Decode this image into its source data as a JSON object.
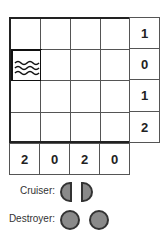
{
  "puzzle": {
    "rows": 4,
    "cols": 4,
    "row_clues": [
      "1",
      "0",
      "1",
      "2"
    ],
    "col_clues": [
      "2",
      "0",
      "2",
      "0"
    ],
    "given_cells": [
      {
        "row": 1,
        "col": 0,
        "type": "water"
      }
    ]
  },
  "legend": {
    "cruiser_label": "Cruiser:",
    "destroyer_label": "Destroyer:"
  },
  "colors": {
    "ship_fill": "#8a8a8a",
    "grid_line": "#222222"
  }
}
